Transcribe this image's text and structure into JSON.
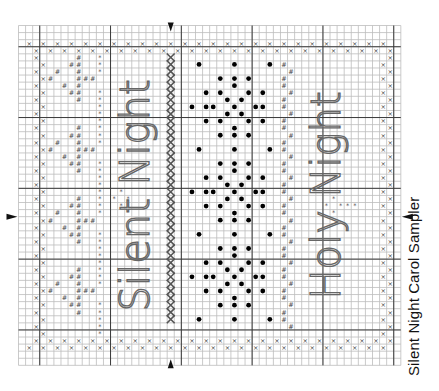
{
  "title": "Silent Night Carol Sampler",
  "grid": {
    "origin_x": 18.5,
    "origin_y": 25.5,
    "cell": 7.08,
    "cols": 54,
    "rows": 48,
    "major_every": 10,
    "major_col_offset": 3,
    "major_row_offset": 3,
    "colors": {
      "minor": "#bdbdbd",
      "major": "#3a3a3a",
      "symbol": "#444444",
      "dot": "#000000",
      "letter": "#666666",
      "arrow": "#111111"
    }
  },
  "center_arrows": {
    "col": 21.5,
    "row": 27
  },
  "lettering": [
    {
      "text": "Silent Night",
      "col": 16.5,
      "row": 24,
      "rotation": -90
    },
    {
      "text": "Holy Night",
      "col": 43.5,
      "row": 24,
      "rotation": -90
    }
  ],
  "legend_symbols": {
    "x": "border cross stitch",
    "#": "star motif stitch",
    "*": "star accent",
    "dot": "snowflake dot",
    "X": "column cross band"
  }
}
